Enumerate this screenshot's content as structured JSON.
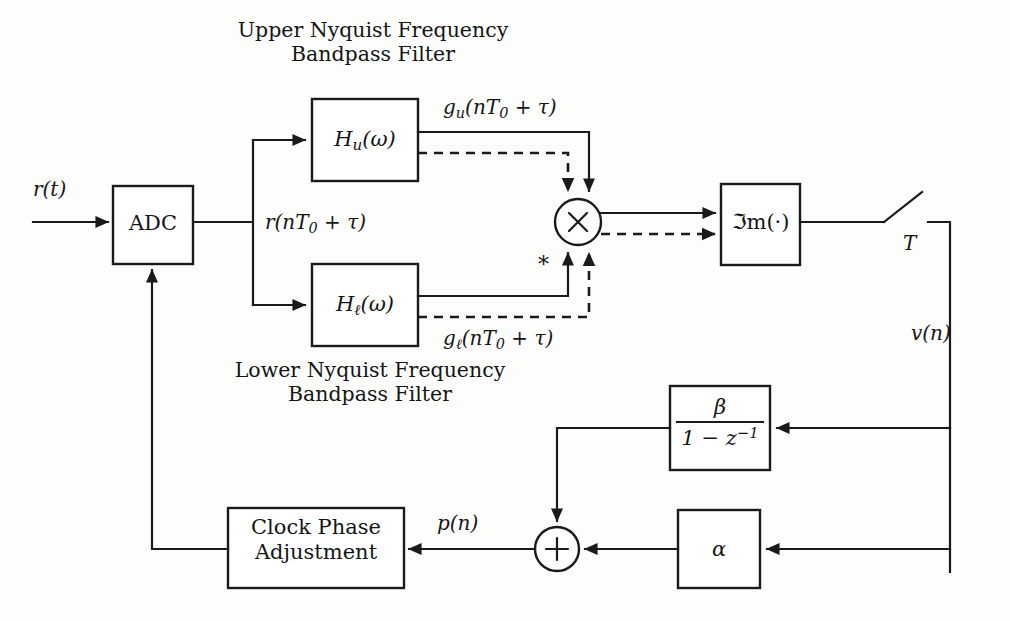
{
  "figure": {
    "type": "block-diagram",
    "domain": "signal-processing",
    "title_captions": {
      "upper_filter_caption_line1": "Upper Nyquist Frequency",
      "upper_filter_caption_line2": "Bandpass Filter",
      "lower_filter_caption_line1": "Lower Nyquist Frequency",
      "lower_filter_caption_line2": "Bandpass Filter"
    },
    "blocks": {
      "adc": {
        "label": "ADC"
      },
      "upper_filter": {
        "label_base": "H",
        "label_sub": "u",
        "label_arg": "(ω)"
      },
      "lower_filter": {
        "label_base": "H",
        "label_sub": "ℓ",
        "label_arg": "(ω)"
      },
      "multiplier": {
        "label": "×"
      },
      "imaginary_part": {
        "label": "ℑm(·)"
      },
      "integrator": {
        "numerator": "β",
        "denominator_pre": "1 − z",
        "denominator_sup": "−1"
      },
      "gain_alpha": {
        "label": "α"
      },
      "summer": {
        "label": "+"
      },
      "clock_phase": {
        "line1": "Clock Phase",
        "line2": "Adjustment"
      }
    },
    "signals": {
      "input": "r(t)",
      "adc_output_base": "r",
      "adc_output_arg": "(nT",
      "adc_output_sub": "0",
      "adc_output_tail": " + τ)",
      "upper_branch_base": "g",
      "upper_branch_sub": "u",
      "lower_branch_base": "g",
      "lower_branch_sub": "ℓ",
      "sample_period": "T",
      "timing_error": "v(n)",
      "phase_control": "p(n)",
      "conjugate_marker_upper": "*",
      "conjugate_marker_lower": "*"
    },
    "colors": {
      "ink": "#1a1a1a",
      "paper": "#fdfdfc"
    }
  }
}
